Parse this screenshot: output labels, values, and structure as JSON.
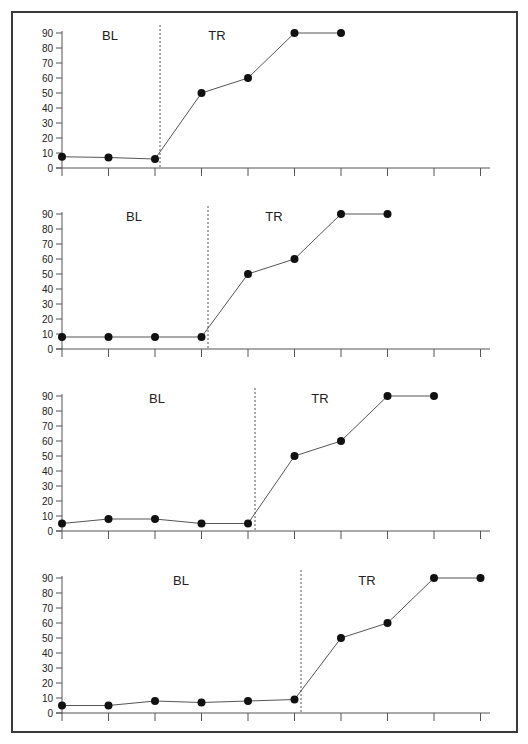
{
  "chart_data": [
    {
      "type": "line",
      "title": "",
      "xlabel": "",
      "ylabel": "",
      "ylim": [
        0,
        90
      ],
      "yticks": [
        0,
        10,
        20,
        30,
        40,
        50,
        60,
        70,
        80,
        90
      ],
      "x_ticks_count": 10,
      "grid": false,
      "phase_labels": [
        "BL",
        "TR"
      ],
      "phase_change_after_session": 3,
      "series": [
        {
          "name": "data",
          "x": [
            1,
            2,
            3,
            4,
            5,
            6,
            7
          ],
          "values": [
            7.5,
            7,
            6,
            50,
            60,
            90,
            90
          ]
        }
      ]
    },
    {
      "type": "line",
      "title": "",
      "xlabel": "",
      "ylabel": "",
      "ylim": [
        0,
        90
      ],
      "yticks": [
        0,
        10,
        20,
        30,
        40,
        50,
        60,
        70,
        80,
        90
      ],
      "x_ticks_count": 9,
      "grid": false,
      "phase_labels": [
        "BL",
        "TR"
      ],
      "phase_change_after_session": 4,
      "series": [
        {
          "name": "data",
          "x": [
            1,
            2,
            3,
            4,
            5,
            6,
            7,
            8
          ],
          "values": [
            8,
            8,
            8,
            8,
            50,
            60,
            90,
            90
          ]
        }
      ]
    },
    {
      "type": "line",
      "title": "",
      "xlabel": "",
      "ylabel": "",
      "ylim": [
        0,
        90
      ],
      "yticks": [
        0,
        10,
        20,
        30,
        40,
        50,
        60,
        70,
        80,
        90
      ],
      "x_ticks_count": 10,
      "grid": false,
      "phase_labels": [
        "BL",
        "TR"
      ],
      "phase_change_after_session": 5,
      "series": [
        {
          "name": "data",
          "x": [
            1,
            2,
            3,
            4,
            5,
            6,
            7,
            8,
            9
          ],
          "values": [
            5,
            8,
            8,
            5,
            5,
            50,
            60,
            90,
            90
          ]
        }
      ]
    },
    {
      "type": "line",
      "title": "",
      "xlabel": "",
      "ylabel": "",
      "ylim": [
        0,
        90
      ],
      "yticks": [
        0,
        10,
        20,
        30,
        40,
        50,
        60,
        70,
        80,
        90
      ],
      "x_ticks_count": 10,
      "grid": false,
      "phase_labels": [
        "BL",
        "TR"
      ],
      "phase_change_after_session": 6,
      "series": [
        {
          "name": "data",
          "x": [
            1,
            2,
            3,
            4,
            5,
            6,
            7,
            8,
            9,
            10
          ],
          "values": [
            5,
            5,
            8,
            7,
            8,
            9,
            50,
            60,
            90,
            90
          ]
        }
      ]
    }
  ],
  "layout": {
    "panels": [
      {
        "zero_y": 168,
        "top_y": 33,
        "phase_line_x": 160,
        "bl_label_x": 110,
        "tr_label_x": 217,
        "label_y": 40
      },
      {
        "zero_y": 349,
        "top_y": 214,
        "phase_line_x": 208,
        "bl_label_x": 134,
        "tr_label_x": 274,
        "label_y": 221
      },
      {
        "zero_y": 531,
        "top_y": 396,
        "phase_line_x": 255,
        "bl_label_x": 157,
        "tr_label_x": 320,
        "label_y": 403
      },
      {
        "zero_y": 713,
        "top_y": 578,
        "phase_line_x": 301,
        "bl_label_x": 181,
        "tr_label_x": 367,
        "label_y": 585
      }
    ],
    "axis_x": 62,
    "x_spacing": 46.5,
    "axis_end_x": 490,
    "colors": {
      "line": "#555555",
      "marker": "#111111",
      "axis": "#555555",
      "phase_line": "#555555"
    }
  }
}
